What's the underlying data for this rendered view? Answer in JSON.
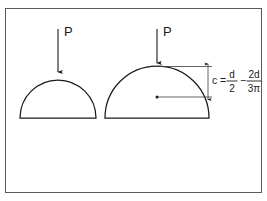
{
  "figure": {
    "background_color": "#f1f1f1",
    "panel_color": "#ffffff",
    "border_color": "#5a5a5a",
    "ink_color": "#1a1a1a"
  },
  "left_shape": {
    "name": "small semicircle",
    "load_label": "P"
  },
  "right_shape": {
    "name": "large semicircle",
    "load_label": "P"
  },
  "annotation": {
    "variable": "c",
    "equals": "=",
    "minus": "−",
    "term1_numerator": "d",
    "term1_denominator": "2",
    "term2_numerator": "2d",
    "term2_denominator": "3π",
    "full_expression": "c = d/2 − 2d/3π"
  }
}
